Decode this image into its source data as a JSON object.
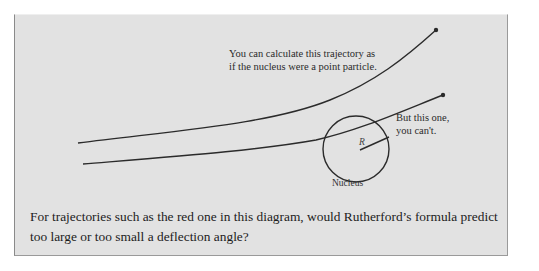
{
  "diagram": {
    "labels": {
      "top_trajectory_line1": "You can calculate this trajectory as",
      "top_trajectory_line2": "if the nucleus were a point particle.",
      "bottom_trajectory_line1": "But this one,",
      "bottom_trajectory_line2": "you can't.",
      "radius": "R",
      "nucleus": "Nucleus"
    },
    "colors": {
      "panel_background": "#e2e2e2",
      "line_color": "#2b2b2b",
      "text_color": "#1c1c1c"
    }
  },
  "question": {
    "text": "For trajectories such as the red one in this diagram, would Rutherford’s formula predict too large or too small a deflection angle?"
  }
}
